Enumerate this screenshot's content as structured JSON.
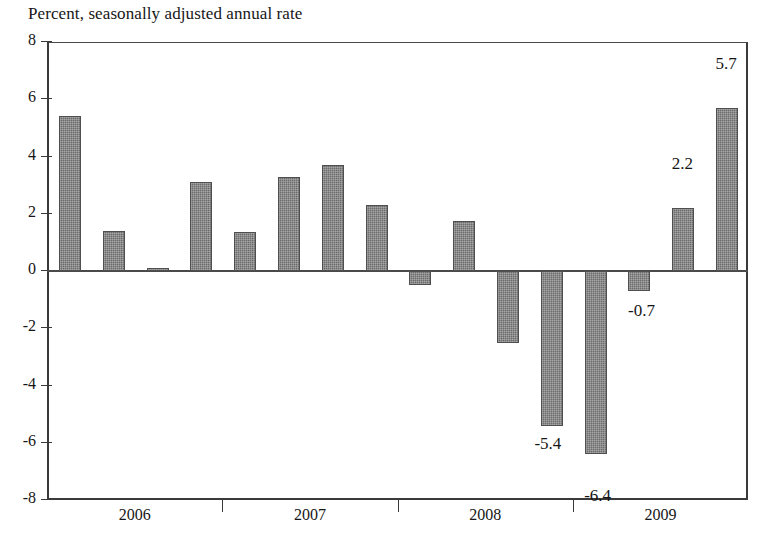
{
  "chart_data": {
    "type": "bar",
    "title": "Percent, seasonally adjusted annual rate",
    "xlabel": "",
    "ylabel": "",
    "ylim": [
      -8,
      8
    ],
    "ytick_values": [
      8,
      6,
      4,
      2,
      0,
      -2,
      -4,
      -6,
      -8
    ],
    "ytick_labels": [
      "8",
      "6",
      "4",
      "2",
      "0",
      "-2",
      "-4",
      "-6",
      "-8"
    ],
    "grid": false,
    "legend": "none",
    "year_labels": [
      "2006",
      "2007",
      "2008",
      "2009"
    ],
    "categories": [
      "2006Q1",
      "2006Q2",
      "2006Q3",
      "2006Q4",
      "2007Q1",
      "2007Q2",
      "2007Q3",
      "2007Q4",
      "2008Q1",
      "2008Q2",
      "2008Q3",
      "2008Q4",
      "2009Q1",
      "2009Q2",
      "2009Q3",
      "2009Q4"
    ],
    "values": [
      5.4,
      1.4,
      0.1,
      3.1,
      1.35,
      3.3,
      3.7,
      2.3,
      -0.5,
      1.75,
      -2.5,
      -5.4,
      -6.4,
      -0.7,
      2.2,
      5.7
    ],
    "point_labels": [
      {
        "index": 11,
        "text": "-5.4"
      },
      {
        "index": 12,
        "text": "-6.4"
      },
      {
        "index": 13,
        "text": "-0.7"
      },
      {
        "index": 14,
        "text": "2.2"
      },
      {
        "index": 15,
        "text": "5.7"
      }
    ],
    "bar_color": "#6b6b6b",
    "axis_color": "#3a3a3a"
  }
}
